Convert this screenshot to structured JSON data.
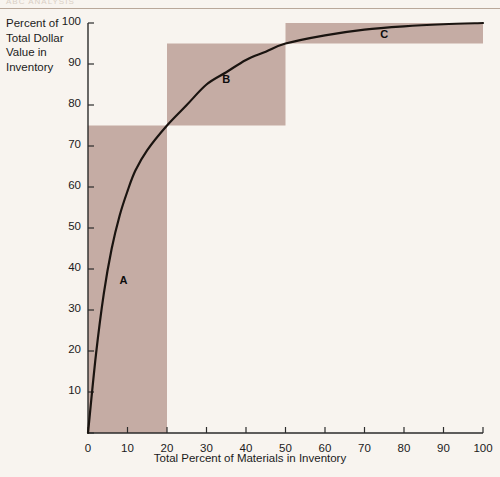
{
  "page": {
    "header_ghost_text": "ABC ANALYSIS"
  },
  "chart_data": {
    "type": "line",
    "title": "",
    "xlabel": "Total Percent of Materials in Inventory",
    "ylabel": "Percent of Total Dollar Value in Inventory",
    "ylabel_lines": [
      "Percent of",
      "Total Dollar",
      "Value in",
      "Inventory"
    ],
    "xlim": [
      0,
      100
    ],
    "ylim": [
      0,
      100
    ],
    "grid": false,
    "legend": "none",
    "xticks": [
      0,
      10,
      20,
      30,
      40,
      50,
      60,
      70,
      80,
      90,
      100
    ],
    "yticks": [
      0,
      10,
      20,
      30,
      40,
      50,
      60,
      70,
      80,
      90,
      100
    ],
    "ytick_labels": [
      "",
      "10",
      "20",
      "30",
      "40",
      "50",
      "60",
      "70",
      "80",
      "90",
      "100"
    ],
    "xtick_labels": [
      "0",
      "10",
      "20",
      "30",
      "40",
      "50",
      "60",
      "70",
      "80",
      "90",
      "100"
    ],
    "series": [
      {
        "name": "Cumulative percent of dollar value",
        "x": [
          0,
          2,
          4,
          6,
          8,
          10,
          12,
          15,
          20,
          25,
          30,
          35,
          40,
          45,
          50,
          60,
          70,
          80,
          90,
          100
        ],
        "values": [
          0,
          19,
          34,
          45,
          53,
          59,
          64,
          69,
          75,
          80,
          85,
          88,
          91,
          93,
          95,
          97,
          98.4,
          99.2,
          99.7,
          100
        ]
      }
    ],
    "annotations": [
      {
        "label": "A",
        "x": 9,
        "y": 37,
        "region": {
          "x0": 0,
          "x1": 20,
          "y0": 0,
          "y1": 75
        }
      },
      {
        "label": "B",
        "x": 35,
        "y": 86,
        "region": {
          "x0": 20,
          "x1": 50,
          "y0": 75,
          "y1": 95
        }
      },
      {
        "label": "C",
        "x": 75,
        "y": 97,
        "region": {
          "x0": 50,
          "x1": 100,
          "y0": 95,
          "y1": 100
        }
      }
    ],
    "colors": {
      "shade": "#c5aca4",
      "curve": "#1a1410",
      "axis": "#2b2b2b",
      "background": "#f8f4ef"
    }
  }
}
